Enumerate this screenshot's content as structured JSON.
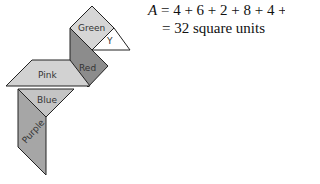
{
  "shapes": [
    {
      "name": "Green",
      "fill": "#d6d6d6"
    },
    {
      "name": "Y",
      "fill": "#ffffff"
    },
    {
      "name": "Red",
      "fill": "#8c8c8c"
    },
    {
      "name": "Pink",
      "fill": "#d2d2d2"
    },
    {
      "name": "Blue",
      "fill": "#c4c4c4"
    },
    {
      "name": "Purple",
      "fill": "#a6a6a6"
    }
  ],
  "equation": {
    "variable": "A",
    "line1": "= 4 + 6 + 2 + 8 + 4 + 8",
    "line2": "= 32 square units"
  }
}
